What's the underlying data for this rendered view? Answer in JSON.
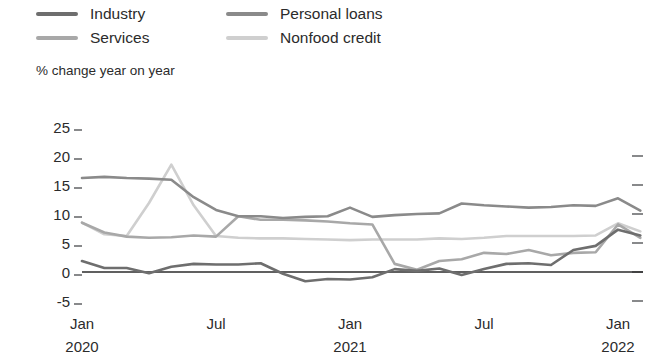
{
  "chart_data": {
    "type": "line",
    "title": "",
    "subtitle": "",
    "xlabel": "",
    "ylabel": "% change year on year",
    "ylim": [
      -7,
      26
    ],
    "yticks": [
      25,
      20,
      15,
      10,
      5,
      0,
      -5
    ],
    "ytick_labels": [
      "25",
      "20",
      "15",
      "10",
      "5",
      "0",
      "-5"
    ],
    "right_yticks": [
      20,
      15,
      10,
      5,
      0,
      -5
    ],
    "grid": false,
    "zero_line": true,
    "legend_position": "top-left",
    "x": [
      "Jan 2020",
      "Feb 2020",
      "Mar 2020",
      "Apr 2020",
      "May 2020",
      "Jun 2020",
      "Jul 2020",
      "Aug 2020",
      "Sep 2020",
      "Oct 2020",
      "Nov 2020",
      "Dec 2020",
      "Jan 2021",
      "Feb 2021",
      "Mar 2021",
      "Apr 2021",
      "May 2021",
      "Jun 2021",
      "Jul 2021",
      "Aug 2021",
      "Sep 2021",
      "Oct 2021",
      "Nov 2021",
      "Dec 2021",
      "Jan 2022",
      "Feb 2022"
    ],
    "xticks": [
      "Jan",
      "Jul",
      "Jan",
      "Jul",
      "Jan"
    ],
    "xtick_sublabels": [
      "2020",
      "",
      "2021",
      "",
      "2022"
    ],
    "xtick_index": [
      0,
      6,
      12,
      18,
      24
    ],
    "series": [
      {
        "name": "Industry",
        "color": "#6e6e6e",
        "values": [
          1.9,
          0.7,
          0.7,
          -0.2,
          0.9,
          1.4,
          1.3,
          1.3,
          1.5,
          -0.3,
          -1.6,
          -1.2,
          -1.3,
          -0.9,
          0.5,
          0.2,
          0.6,
          -0.5,
          0.5,
          1.4,
          1.5,
          1.2,
          3.8,
          4.5,
          7.3,
          6.3
        ]
      },
      {
        "name": "Services",
        "color": "#a8a8a8",
        "values": [
          8.5,
          6.8,
          6.1,
          5.9,
          6.0,
          6.3,
          6.1,
          9.6,
          9.0,
          9.0,
          8.9,
          8.7,
          8.4,
          8.2,
          1.4,
          0.4,
          1.9,
          2.2,
          3.3,
          3.1,
          3.8,
          2.9,
          3.3,
          3.4,
          8.2,
          5.9
        ]
      },
      {
        "name": "Personal loans",
        "color": "#8a8a8a",
        "values": [
          16.2,
          16.4,
          16.2,
          16.1,
          15.9,
          12.9,
          10.7,
          9.6,
          9.6,
          9.3,
          9.5,
          9.6,
          11.1,
          9.5,
          9.8,
          10.0,
          10.1,
          11.8,
          11.5,
          11.3,
          11.1,
          11.2,
          11.5,
          11.4,
          12.7,
          10.6
        ]
      },
      {
        "name": "Nonfood credit",
        "color": "#cfcfcf",
        "values": [
          8.5,
          6.5,
          6.2,
          11.9,
          18.5,
          11.5,
          6.2,
          5.9,
          5.8,
          5.8,
          5.7,
          5.6,
          5.5,
          5.6,
          5.6,
          5.6,
          5.8,
          5.7,
          5.9,
          6.2,
          6.2,
          6.2,
          6.2,
          6.3,
          8.4,
          7.0
        ]
      }
    ]
  },
  "legend": {
    "items": [
      {
        "label": "Industry"
      },
      {
        "label": "Services"
      },
      {
        "label": "Personal loans"
      },
      {
        "label": "Nonfood credit"
      }
    ]
  }
}
